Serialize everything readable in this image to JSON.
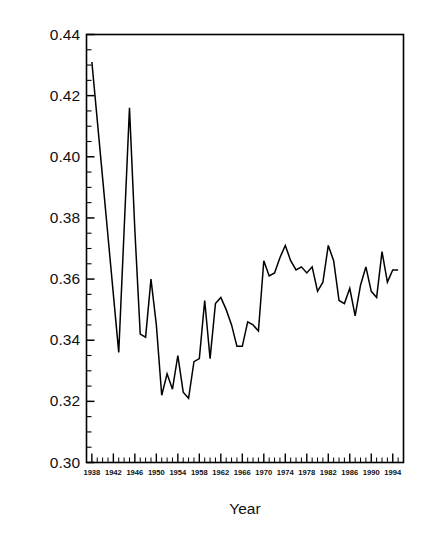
{
  "chart_data": {
    "type": "line",
    "title": "",
    "xlabel": "Year",
    "ylabel": "Average Proportion of Lost Wages Replaced",
    "xlim": [
      1937,
      1996
    ],
    "ylim": [
      0.3,
      0.44
    ],
    "grid": false,
    "legend": null,
    "line_color": "#000000",
    "y_ticks": [
      "0.44",
      "0.42",
      "0.40",
      "0.38",
      "0.36",
      "0.34",
      "0.32",
      "0.30"
    ],
    "y_tick_values": [
      0.44,
      0.42,
      0.4,
      0.38,
      0.36,
      0.34,
      0.32,
      0.3
    ],
    "y_minor_interval": 0.005,
    "x_ticks": [
      "1938",
      "1942",
      "1946",
      "1950",
      "1954",
      "1958",
      "1962",
      "1966",
      "1970",
      "1974",
      "1978",
      "1982",
      "1986",
      "1990",
      "1994"
    ],
    "x_tick_values": [
      1938,
      1942,
      1946,
      1950,
      1954,
      1958,
      1962,
      1966,
      1970,
      1974,
      1978,
      1982,
      1986,
      1990,
      1994
    ],
    "x_minor_interval": 1,
    "x": [
      1938,
      1939,
      1940,
      1941,
      1942,
      1943,
      1944,
      1945,
      1946,
      1947,
      1948,
      1949,
      1950,
      1951,
      1952,
      1953,
      1954,
      1955,
      1956,
      1957,
      1958,
      1959,
      1960,
      1961,
      1962,
      1963,
      1964,
      1965,
      1966,
      1967,
      1968,
      1969,
      1970,
      1971,
      1972,
      1973,
      1974,
      1975,
      1976,
      1977,
      1978,
      1979,
      1980,
      1981,
      1982,
      1983,
      1984,
      1985,
      1986,
      1987,
      1988,
      1989,
      1990,
      1991,
      1992,
      1993,
      1994,
      1995
    ],
    "y": [
      0.431,
      0.412,
      0.393,
      0.374,
      0.355,
      0.336,
      0.376,
      0.416,
      0.376,
      0.342,
      0.341,
      0.36,
      0.345,
      0.322,
      0.329,
      0.324,
      0.335,
      0.323,
      0.321,
      0.333,
      0.334,
      0.353,
      0.334,
      0.352,
      0.354,
      0.35,
      0.345,
      0.338,
      0.338,
      0.346,
      0.345,
      0.343,
      0.366,
      0.361,
      0.362,
      0.367,
      0.371,
      0.366,
      0.363,
      0.364,
      0.362,
      0.364,
      0.356,
      0.359,
      0.371,
      0.366,
      0.353,
      0.352,
      0.357,
      0.348,
      0.358,
      0.364,
      0.356,
      0.354,
      0.369,
      0.359,
      0.363,
      0.363
    ],
    "series": [
      {
        "name": "Average Proportion of Lost Wages Replaced",
        "values": [
          0.431,
          0.412,
          0.393,
          0.374,
          0.355,
          0.336,
          0.376,
          0.416,
          0.376,
          0.342,
          0.341,
          0.36,
          0.345,
          0.322,
          0.329,
          0.324,
          0.335,
          0.323,
          0.321,
          0.333,
          0.334,
          0.353,
          0.334,
          0.352,
          0.354,
          0.35,
          0.345,
          0.338,
          0.338,
          0.346,
          0.345,
          0.343,
          0.366,
          0.361,
          0.362,
          0.367,
          0.371,
          0.366,
          0.363,
          0.364,
          0.362,
          0.364,
          0.356,
          0.359,
          0.371,
          0.366,
          0.353,
          0.352,
          0.357,
          0.348,
          0.358,
          0.364,
          0.356,
          0.354,
          0.369,
          0.359,
          0.363,
          0.363
        ]
      }
    ]
  }
}
